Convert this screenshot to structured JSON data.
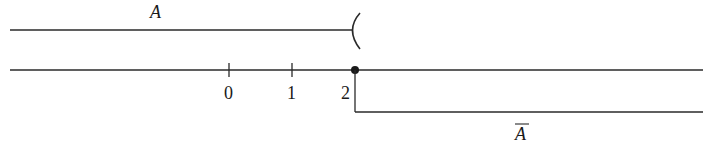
{
  "diagram": {
    "type": "number-line-sets",
    "set_a": {
      "label": "A",
      "interval": "(-inf, 2)",
      "right_endpoint": 2,
      "right_bracket": "(",
      "endpoint_open": true
    },
    "complement": {
      "label": "A",
      "label_overline": true,
      "interval": "[2, inf)",
      "left_endpoint": 2,
      "endpoint_closed": true
    },
    "number_line": {
      "ticks": [
        {
          "value": 0,
          "label": "0"
        },
        {
          "value": 1,
          "label": "1"
        },
        {
          "value": 2,
          "label": "2"
        }
      ],
      "marked_point": 2
    },
    "colors": {
      "stroke": "#2a2a2a",
      "text": "#1a1a1a",
      "background": "#ffffff"
    }
  }
}
